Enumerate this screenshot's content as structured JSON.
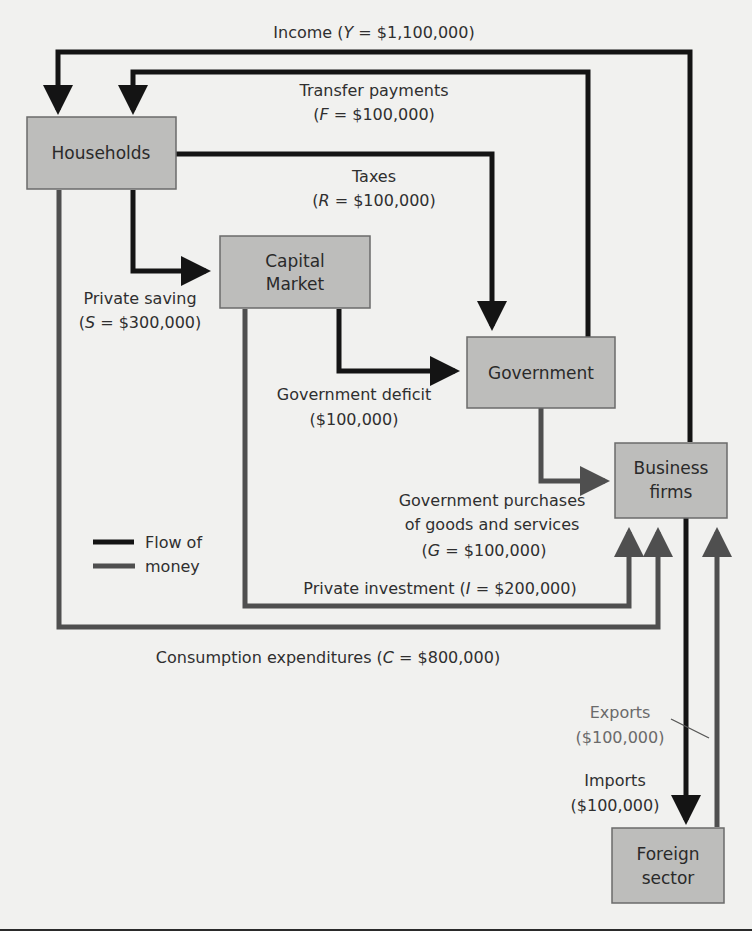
{
  "diagram": {
    "type": "circular-flow-of-income",
    "nodes": {
      "households": {
        "label": "Households"
      },
      "capital_market": {
        "line1": "Capital",
        "line2": "Market"
      },
      "government": {
        "label": "Government"
      },
      "business_firms": {
        "line1": "Business",
        "line2": "firms"
      },
      "foreign_sector": {
        "line1": "Foreign",
        "line2": "sector"
      }
    },
    "flows": {
      "income": {
        "text": "Income (",
        "var": "Y",
        "value": " = $1,100,000)",
        "from": "Business firms",
        "to": "Households",
        "color": "black"
      },
      "transfer_payments": {
        "line1": "Transfer payments",
        "open": "(",
        "var": "F",
        "value": " = $100,000)",
        "from": "Government",
        "to": "Households",
        "color": "black"
      },
      "taxes": {
        "line1": "Taxes",
        "open": "(",
        "var": "R",
        "value": " = $100,000)",
        "from": "Households",
        "to": "Government",
        "color": "black"
      },
      "private_saving": {
        "line1": "Private saving",
        "open": "(",
        "var": "S",
        "value": " = $300,000)",
        "from": "Households",
        "to": "Capital Market",
        "color": "black"
      },
      "government_deficit": {
        "line1": "Government deficit",
        "line2": "($100,000)",
        "from": "Capital Market",
        "to": "Government",
        "color": "black"
      },
      "government_purchases": {
        "line1": "Government purchases",
        "line2": "of goods and services",
        "open": "(",
        "var": "G",
        "value": " = $100,000)",
        "from": "Government",
        "to": "Business firms",
        "color": "gray"
      },
      "private_investment": {
        "text": "Private investment (",
        "var": "I",
        "value": " = $200,000)",
        "from": "Capital Market",
        "to": "Business firms",
        "color": "gray"
      },
      "consumption": {
        "text": "Consumption expenditures (",
        "var": "C",
        "value": " = $800,000)",
        "from": "Households",
        "to": "Business firms",
        "color": "gray"
      },
      "exports": {
        "line1": "Exports",
        "line2": "($100,000)",
        "from": "Foreign sector",
        "to": "Business firms",
        "color": "gray"
      },
      "imports": {
        "line1": "Imports",
        "line2": "($100,000)",
        "from": "Business firms",
        "to": "Foreign sector",
        "color": "black"
      }
    },
    "legend": {
      "line1": "Flow of",
      "line2": "money",
      "items": [
        {
          "color": "#141414",
          "meaning": "black flow"
        },
        {
          "color": "#4f4f4f",
          "meaning": "gray flow"
        }
      ]
    },
    "colors": {
      "background": "#f1f1ef",
      "box_fill": "#bdbdbb",
      "black_flow": "#141414",
      "gray_flow": "#4f4f4f"
    }
  }
}
